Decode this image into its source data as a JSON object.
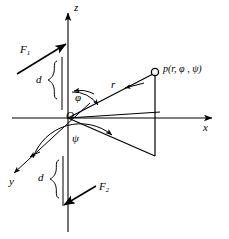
{
  "figure": {
    "type": "spherical-coordinate-force-couple-diagram",
    "background_color": "#ffffff",
    "stroke_color": "#000000",
    "axes": {
      "z_label": "z",
      "x_label": "x",
      "y_label": "y"
    },
    "origin": {
      "label": "O",
      "x": 68,
      "y": 118
    },
    "point": {
      "label": "p(r, φ , ψ)",
      "marker": "open-circle",
      "x": 155,
      "y": 72
    },
    "vectors": {
      "radial_label": "r",
      "force_upper_label": "F",
      "force_upper_subscript": "1",
      "force_lower_label": "F",
      "force_lower_subscript": "2"
    },
    "angles": {
      "polar_label": "φ",
      "azimuth_label": "ψ"
    },
    "distances": {
      "upper_label": "d",
      "lower_label": "d"
    }
  }
}
